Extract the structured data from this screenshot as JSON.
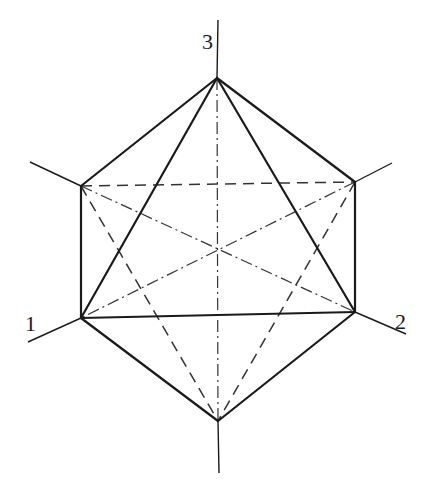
{
  "diagram": {
    "title": "",
    "labels": {
      "axis1": "1",
      "axis2": "2",
      "axis3": "3"
    },
    "vertices": {
      "top": [
        217,
        78
      ],
      "upper_left": [
        81,
        186
      ],
      "upper_right": [
        355,
        182
      ],
      "lower_left": [
        81,
        318
      ],
      "lower_right": [
        355,
        312
      ],
      "bottom": [
        218,
        421
      ]
    },
    "edges": {
      "solid": [
        [
          "top",
          "upper_left"
        ],
        [
          "top",
          "upper_right"
        ],
        [
          "upper_left",
          "lower_left"
        ],
        [
          "upper_right",
          "lower_right"
        ],
        [
          "lower_left",
          "bottom"
        ],
        [
          "lower_right",
          "bottom"
        ],
        [
          "top",
          "lower_left"
        ],
        [
          "top",
          "lower_right"
        ],
        [
          "lower_left",
          "lower_right"
        ]
      ],
      "dashed": [
        [
          "upper_left",
          "upper_right"
        ],
        [
          "upper_left",
          "bottom"
        ],
        [
          "upper_right",
          "bottom"
        ]
      ],
      "dashdot": [
        [
          "top",
          "bottom"
        ],
        [
          "upper_left",
          "lower_right"
        ],
        [
          "upper_right",
          "lower_left"
        ]
      ]
    },
    "colors": {
      "line": "#1a1a1a",
      "background": "#ffffff"
    }
  }
}
